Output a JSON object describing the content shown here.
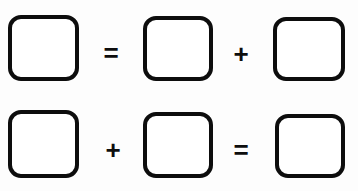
{
  "canvas": {
    "width": 358,
    "height": 191,
    "background_color": "#fdfdfd"
  },
  "style": {
    "box_fill_color": "#ffffff",
    "box_border_color": "#0d0d0d",
    "operator_color": "#0d0d0d"
  },
  "equations": [
    {
      "id": "equation-1",
      "expression": "box = box + box",
      "elements": [
        {
          "kind": "box",
          "name": "answer-box",
          "value": ""
        },
        {
          "kind": "operator",
          "name": "equals-sign",
          "value": "="
        },
        {
          "kind": "box",
          "name": "answer-box",
          "value": ""
        },
        {
          "kind": "operator",
          "name": "plus-sign",
          "value": "+"
        },
        {
          "kind": "box",
          "name": "answer-box",
          "value": ""
        }
      ]
    },
    {
      "id": "equation-2",
      "expression": "box + box = box",
      "elements": [
        {
          "kind": "box",
          "name": "answer-box",
          "value": ""
        },
        {
          "kind": "operator",
          "name": "plus-sign",
          "value": "+"
        },
        {
          "kind": "box",
          "name": "answer-box",
          "value": ""
        },
        {
          "kind": "operator",
          "name": "equals-sign",
          "value": "="
        },
        {
          "kind": "box",
          "name": "answer-box",
          "value": ""
        }
      ]
    }
  ]
}
